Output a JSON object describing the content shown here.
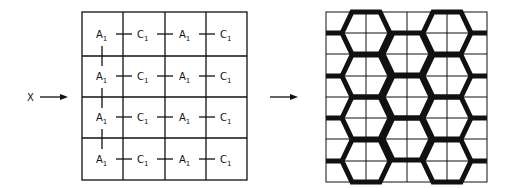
{
  "input_label": "X",
  "left_grid": {
    "rows": 4,
    "cols": 4,
    "cells": [
      [
        "A",
        "C",
        "A",
        "C"
      ],
      [
        "A",
        "C",
        "A",
        "C"
      ],
      [
        "A",
        "C",
        "A",
        "C"
      ],
      [
        "A",
        "C",
        "A",
        "C"
      ]
    ],
    "subscript": "1"
  },
  "right_grid": {
    "rows": 8,
    "cols": 4,
    "pattern": "hexagonal lattice"
  },
  "colors": {
    "ink": "#111111",
    "background": "#ffffff"
  }
}
